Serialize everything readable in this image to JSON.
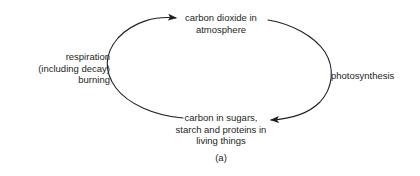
{
  "figure": {
    "caption": "(a)",
    "background_color": "#ffffff",
    "stroke_color": "#231f20",
    "text_color": "#231f20"
  },
  "diagram": {
    "type": "carbon-cycle",
    "nodes": [
      {
        "id": "atmosphere",
        "text": "carbon dioxide in\natmosphere",
        "position": "top"
      },
      {
        "id": "living-things",
        "text": "carbon in sugars,\nstarch and proteins in\nliving things",
        "position": "bottom"
      }
    ],
    "arrows": [
      {
        "id": "respiration",
        "text": "respiration\n(including decay)\nburning",
        "position": "left",
        "from": "living-things",
        "to": "atmosphere",
        "direction": "up"
      },
      {
        "id": "photosynthesis",
        "text": "photosynthesis",
        "position": "right",
        "from": "atmosphere",
        "to": "living-things",
        "direction": "down"
      }
    ]
  }
}
